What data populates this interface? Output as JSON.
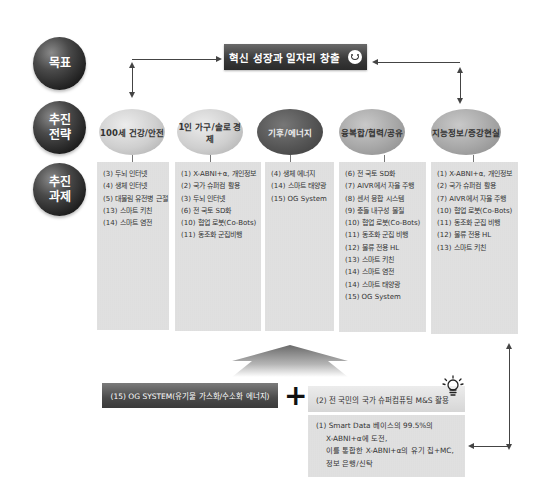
{
  "row_labels": {
    "goal": "목표",
    "strategy_line1": "추진",
    "strategy_line2": "전략",
    "tasks_line1": "추진",
    "tasks_line2": "과제"
  },
  "goal": {
    "title": "혁신 성장과 일자리 창출",
    "icon": "smiley-icon"
  },
  "strategies": [
    {
      "label": "100세 건강/안전",
      "shade": "light"
    },
    {
      "label": "1인 가구/솔로 경제",
      "shade": "light"
    },
    {
      "label": "기후/에너지",
      "shade": "dark"
    },
    {
      "label": "융복합/협력/공유",
      "shade": "mid"
    },
    {
      "label": "지능정보/증강현실",
      "shade": "mid"
    }
  ],
  "tasks": [
    [
      "(3) 두뇌 인터넷",
      "(4) 생체 인터넷",
      "(5) 대물림 유전병 근절",
      "(13) 스마트 키친",
      "(14) 스마트 염전"
    ],
    [
      "(1) X-ABNI+α, 개인정보",
      "(2) 국가 슈퍼컴 활용",
      "(3) 두뇌 인터넷",
      "(6) 전 국토 SD화",
      "(10) 협업 로봇(Co-Bots)",
      "(11) 동조화 군집비행"
    ],
    [
      "(4) 생체 에너지",
      "(14) 스마트 태양광",
      "(15) OG System"
    ],
    [
      "(6) 전 국토 SD화",
      "(7) AIVR에서 자율 주행",
      "(8) 센서 융합 시스템",
      "(9) 충돌 내구성 물질",
      "(10) 협업 로봇(Co-Bots)",
      "(11) 동조화 군집 비행",
      "(12) 물류 전용 HL",
      "(13) 스마트 키친",
      "(14) 스마트 염전",
      "(14) 스마트 태양광",
      "(15) OG System"
    ],
    [
      "(1) X-ABNI+α, 개인정보",
      "(2) 국가 슈퍼컴 활용",
      "(7) AIVR에서 자율 주행",
      "(10) 협업 로봇(Co-Bots)",
      "(11) 동조화 군집 비행",
      "(12) 물류 전용 HL",
      "(13) 스마트 키친"
    ]
  ],
  "bottom": {
    "og_system": "(15) OG SYSTEM(유기물 가스화/수소화 에너지)",
    "plus": "+",
    "supercomputing": "(2) 전 국민의 국가 슈퍼컴퓨팅 M&S 활용",
    "smart_data_lines": [
      "(1) Smart Data 베이스의 99.5%의",
      "X-ABNI+α에 도전,",
      "이를 통합한 X-ABNI+α의 유기 칩+MC,",
      "정보 은행/신탁"
    ],
    "bulb_icon": "lightbulb-icon"
  }
}
